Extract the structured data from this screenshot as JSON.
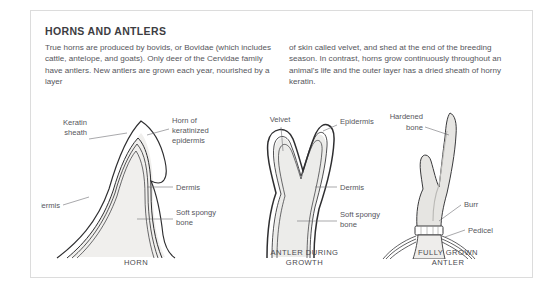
{
  "panel": {
    "title": "HORNS AND ANTLERS",
    "accent_color": "#b3b3b3",
    "border_color": "#dcdcdc",
    "background_color": "#ffffff",
    "text_color": "#56565c",
    "title_color": "#3d3d42"
  },
  "body": {
    "column_left": "True horns are produced by bovids, or Bovidae (which includes cattle, antelope, and goats). Only deer of the Cervidae family have antlers. New antlers are grown each year, nourished by a layer",
    "column_right": "of skin called velvet, and shed at the end of the breeding season. In contrast, horns grow continuously throughout an animal's life and the outer layer has a dried sheath of horny keratin."
  },
  "figures": [
    {
      "id": "horn",
      "caption": "HORN",
      "labels": {
        "keratin_sheath": "Keratin\nsheath",
        "keratin_sheath_line1": "Keratin",
        "keratin_sheath_line2": "sheath",
        "horn_of_line1": "Horn of",
        "horn_of_line2": "keratinized",
        "horn_of_line3": "epidermis",
        "epidermis": "Epidermis",
        "dermis": "Dermis",
        "soft_spongy_line1": "Soft spongy",
        "soft_spongy_line2": "bone"
      }
    },
    {
      "id": "antler-during-growth",
      "caption_line1": "ANTLER DURING",
      "caption_line2": "GROWTH",
      "labels": {
        "velvet": "Velvet",
        "epidermis": "Epidermis",
        "dermis": "Dermis",
        "soft_spongy_line1": "Soft spongy",
        "soft_spongy_line2": "bone"
      }
    },
    {
      "id": "fully-grown-antler",
      "caption_line1": "FULLY GROWN",
      "caption_line2": "ANTLER",
      "labels": {
        "hardened_line1": "Hardened",
        "hardened_line2": "bone",
        "burr": "Burr",
        "pedicel": "Pedicel"
      }
    }
  ]
}
